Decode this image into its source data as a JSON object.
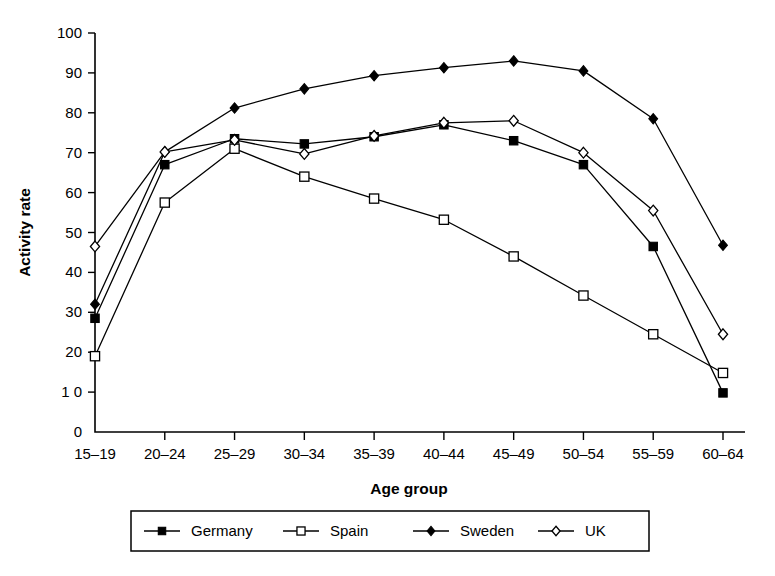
{
  "chart_data": {
    "type": "line",
    "title": "",
    "xlabel": "Age group",
    "ylabel": "Activity rate",
    "categories": [
      "15–19",
      "20–24",
      "25–29",
      "30–34",
      "35–39",
      "40–44",
      "45–49",
      "50–54",
      "55–59",
      "60–64"
    ],
    "ylim": [
      0,
      100
    ],
    "yticks": [
      0,
      10,
      20,
      30,
      40,
      50,
      60,
      70,
      80,
      90,
      100
    ],
    "ytick_labels": [
      "0",
      "1 0",
      "20",
      "30",
      "40",
      "50",
      "60",
      "70",
      "80",
      "90",
      "100"
    ],
    "grid": false,
    "legend_position": "bottom",
    "series": [
      {
        "name": "Germany",
        "marker": "filled-square",
        "values": [
          28.5,
          67.0,
          73.5,
          72.2,
          74.0,
          77.0,
          73.0,
          67.0,
          46.5,
          9.8
        ]
      },
      {
        "name": "Spain",
        "marker": "open-square",
        "values": [
          19.0,
          57.5,
          71.0,
          64.0,
          58.5,
          53.2,
          44.0,
          34.2,
          24.5,
          14.8
        ]
      },
      {
        "name": "Sweden",
        "marker": "filled-diamond",
        "values": [
          32.0,
          70.2,
          81.2,
          86.0,
          89.3,
          91.3,
          93.0,
          90.5,
          78.5,
          46.8
        ]
      },
      {
        "name": "UK",
        "marker": "open-diamond",
        "values": [
          46.5,
          70.2,
          73.2,
          69.7,
          74.2,
          77.5,
          78.0,
          70.0,
          55.5,
          24.5
        ]
      }
    ]
  },
  "legend": {
    "entries": [
      "Germany",
      "Spain",
      "Sweden",
      "UK"
    ]
  },
  "colors": {
    "ink": "#000000",
    "background": "#ffffff"
  }
}
